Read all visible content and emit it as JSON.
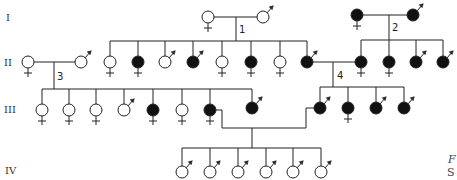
{
  "generations": [
    {
      "label": "I",
      "y": 18
    },
    {
      "label": "II",
      "y": 62
    },
    {
      "label": "III",
      "y": 109
    },
    {
      "label": "IV",
      "y": 170
    }
  ],
  "unions": [
    {
      "label": "1"
    },
    {
      "label": "2"
    },
    {
      "label": "3"
    },
    {
      "label": "4"
    }
  ],
  "caption": {
    "line1": "F",
    "line2": "S"
  },
  "colors": {
    "affected": "#111111",
    "unaffected": "#ffffff",
    "stroke": "#222222"
  },
  "legend": {
    "female_symbol": "circle with cross below",
    "male_symbol": "circle with arrow at upper right",
    "affected": "filled",
    "unaffected": "open"
  },
  "individuals": [
    {
      "id": "I-1",
      "gen": "I",
      "sex": "female",
      "affected": false,
      "x": 208,
      "y": 17
    },
    {
      "id": "I-2",
      "gen": "I",
      "sex": "male",
      "affected": false,
      "x": 263,
      "y": 17
    },
    {
      "id": "I-3",
      "gen": "I",
      "sex": "female",
      "affected": true,
      "x": 357,
      "y": 15
    },
    {
      "id": "I-4",
      "gen": "I",
      "sex": "male",
      "affected": true,
      "x": 413,
      "y": 15
    },
    {
      "id": "II-1",
      "gen": "II",
      "sex": "female",
      "affected": false,
      "x": 28,
      "y": 62
    },
    {
      "id": "II-2",
      "gen": "II",
      "sex": "male",
      "affected": false,
      "x": 81,
      "y": 62
    },
    {
      "id": "II-3",
      "gen": "II",
      "sex": "female",
      "affected": false,
      "x": 110,
      "y": 62
    },
    {
      "id": "II-4",
      "gen": "II",
      "sex": "female",
      "affected": true,
      "x": 138,
      "y": 62
    },
    {
      "id": "II-5",
      "gen": "II",
      "sex": "male",
      "affected": false,
      "x": 165,
      "y": 62
    },
    {
      "id": "II-6",
      "gen": "II",
      "sex": "male",
      "affected": true,
      "x": 193,
      "y": 62
    },
    {
      "id": "II-7",
      "gen": "II",
      "sex": "female",
      "affected": false,
      "x": 222,
      "y": 62
    },
    {
      "id": "II-8",
      "gen": "II",
      "sex": "female",
      "affected": true,
      "x": 251,
      "y": 62
    },
    {
      "id": "II-9",
      "gen": "II",
      "sex": "female",
      "affected": false,
      "x": 280,
      "y": 62
    },
    {
      "id": "II-10",
      "gen": "II",
      "sex": "male",
      "affected": true,
      "x": 307,
      "y": 62
    },
    {
      "id": "II-11",
      "gen": "II",
      "sex": "female",
      "affected": true,
      "x": 361,
      "y": 62
    },
    {
      "id": "II-12",
      "gen": "II",
      "sex": "female",
      "affected": true,
      "x": 389,
      "y": 62
    },
    {
      "id": "II-13",
      "gen": "II",
      "sex": "male",
      "affected": true,
      "x": 416,
      "y": 62
    },
    {
      "id": "II-14",
      "gen": "II",
      "sex": "male",
      "affected": true,
      "x": 443,
      "y": 62
    },
    {
      "id": "III-1",
      "gen": "III",
      "sex": "female",
      "affected": false,
      "x": 42,
      "y": 110
    },
    {
      "id": "III-2",
      "gen": "III",
      "sex": "female",
      "affected": false,
      "x": 69,
      "y": 110
    },
    {
      "id": "III-3",
      "gen": "III",
      "sex": "female",
      "affected": false,
      "x": 96,
      "y": 110
    },
    {
      "id": "III-4",
      "gen": "III",
      "sex": "male",
      "affected": false,
      "x": 124,
      "y": 110
    },
    {
      "id": "III-5",
      "gen": "III",
      "sex": "female",
      "affected": true,
      "x": 153,
      "y": 110
    },
    {
      "id": "III-6",
      "gen": "III",
      "sex": "female",
      "affected": false,
      "x": 182,
      "y": 110
    },
    {
      "id": "III-7",
      "gen": "III",
      "sex": "female",
      "affected": true,
      "x": 210,
      "y": 110
    },
    {
      "id": "III-8",
      "gen": "III",
      "sex": "male",
      "affected": true,
      "x": 252,
      "y": 108
    },
    {
      "id": "III-9",
      "gen": "III",
      "sex": "male",
      "affected": true,
      "x": 320,
      "y": 108
    },
    {
      "id": "III-10",
      "gen": "III",
      "sex": "female",
      "affected": true,
      "x": 348,
      "y": 108
    },
    {
      "id": "III-11",
      "gen": "III",
      "sex": "male",
      "affected": true,
      "x": 376,
      "y": 108
    },
    {
      "id": "III-12",
      "gen": "III",
      "sex": "male",
      "affected": true,
      "x": 404,
      "y": 108
    },
    {
      "id": "IV-1",
      "gen": "IV",
      "sex": "male",
      "affected": false,
      "x": 182,
      "y": 172
    },
    {
      "id": "IV-2",
      "gen": "IV",
      "sex": "male",
      "affected": false,
      "x": 210,
      "y": 172
    },
    {
      "id": "IV-3",
      "gen": "IV",
      "sex": "male",
      "affected": false,
      "x": 238,
      "y": 172
    },
    {
      "id": "IV-4",
      "gen": "IV",
      "sex": "male",
      "affected": false,
      "x": 266,
      "y": 172
    },
    {
      "id": "IV-5",
      "gen": "IV",
      "sex": "male",
      "affected": false,
      "x": 293,
      "y": 172
    },
    {
      "id": "IV-6",
      "gen": "IV",
      "sex": "male",
      "affected": false,
      "x": 321,
      "y": 172
    }
  ]
}
